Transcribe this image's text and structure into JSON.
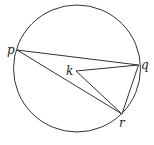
{
  "diagram": {
    "type": "geometry-circle",
    "circle": {
      "cx": 77,
      "cy": 68.5,
      "r": 63.5,
      "stroke": "#333333"
    },
    "points": {
      "p": {
        "label": "p",
        "x": 17,
        "y": 50
      },
      "q": {
        "label": "q",
        "x": 138.5,
        "y": 65
      },
      "r": {
        "label": "r",
        "x": 122,
        "y": 114
      },
      "k": {
        "label": "k",
        "x": 76,
        "y": 71
      }
    },
    "segments": [
      [
        "p",
        "q"
      ],
      [
        "p",
        "r"
      ],
      [
        "q",
        "r"
      ],
      [
        "k",
        "q"
      ],
      [
        "k",
        "r"
      ]
    ]
  }
}
